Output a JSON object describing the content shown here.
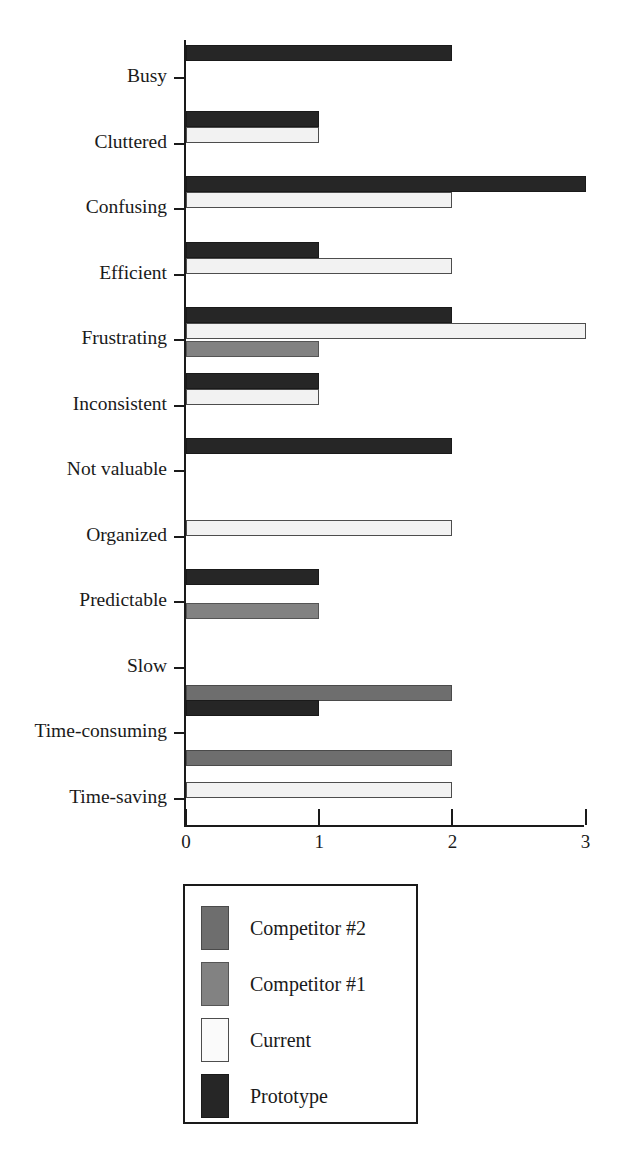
{
  "chart_data": {
    "type": "bar",
    "orientation": "horizontal",
    "title": "",
    "subtitle": "",
    "xlabel": "",
    "ylabel": "",
    "xlim": [
      0,
      3
    ],
    "xticks": [
      0,
      1,
      2,
      3
    ],
    "xtick_labels": [
      "0",
      "1",
      "2",
      "3"
    ],
    "grid": false,
    "legend_position": "bottom-center",
    "categories": [
      "Busy",
      "Cluttered",
      "Confusing",
      "Efficient",
      "Frustrating",
      "Inconsistent",
      "Not valuable",
      "Organized",
      "Predictable",
      "Slow",
      "Time-consuming",
      "Time-saving"
    ],
    "series": [
      {
        "name": "Competitor #2",
        "color": "#6e6e6e",
        "values": [
          0,
          0,
          0,
          0,
          0,
          0,
          0,
          0,
          0,
          2,
          2,
          0
        ]
      },
      {
        "name": "Competitor #1",
        "color": "#828282",
        "values": [
          0,
          0,
          0,
          0,
          1,
          0,
          0,
          0,
          1,
          0,
          0,
          0
        ]
      },
      {
        "name": "Current",
        "color": "#f2f2f2",
        "values": [
          0,
          1,
          2,
          2,
          3,
          1,
          0,
          2,
          0,
          0,
          0,
          2
        ]
      },
      {
        "name": "Prototype",
        "color": "#262626",
        "values": [
          2,
          1,
          3,
          1,
          2,
          1,
          2,
          0,
          1,
          0,
          1,
          0
        ]
      }
    ]
  },
  "axis": {
    "x_tick_labels": [
      "0",
      "1",
      "2",
      "3"
    ],
    "y_category_labels": [
      "Busy",
      "Cluttered",
      "Confusing",
      "Efficient",
      "Frustrating",
      "Inconsistent",
      "Not valuable",
      "Organized",
      "Predictable",
      "Slow",
      "Time-consuming",
      "Time-saving"
    ]
  },
  "legend": {
    "entries": [
      {
        "label": "Competitor #2",
        "swatch": "comp2",
        "color": "#6e6e6e"
      },
      {
        "label": "Competitor #1",
        "swatch": "comp1",
        "color": "#828282"
      },
      {
        "label": "Current",
        "swatch": "current",
        "color": "#f2f2f2"
      },
      {
        "label": "Prototype",
        "swatch": "proto",
        "color": "#262626"
      }
    ]
  }
}
